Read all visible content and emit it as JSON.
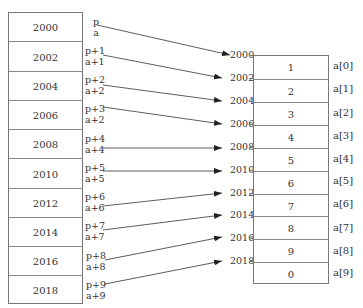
{
  "memory_block": {
    "addresses": [
      "2000",
      "2002",
      "2004",
      "2006",
      "2008",
      "2010",
      "2012",
      "2014",
      "2016",
      "2018"
    ]
  },
  "pointer_labels": [
    {
      "p": "p",
      "a": "a"
    },
    {
      "p": "p+1",
      "a": "a+1"
    },
    {
      "p": "p+2",
      "a": "a+2"
    },
    {
      "p": "p+3",
      "a": "a+2"
    },
    {
      "p": "p+4",
      "a": "a+4"
    },
    {
      "p": "p+5",
      "a": "a+5"
    },
    {
      "p": "p+6",
      "a": "a+6"
    },
    {
      "p": "p+7",
      "a": "a+7"
    },
    {
      "p": "p+8",
      "a": "a+8"
    },
    {
      "p": "p+9",
      "a": "a+9"
    }
  ],
  "array": {
    "addresses": [
      "2000",
      "2002",
      "2004",
      "2006",
      "2008",
      "2010",
      "2012",
      "2014",
      "2016",
      "2018"
    ],
    "values": [
      "1",
      "2",
      "3",
      "4",
      "5",
      "6",
      "7",
      "8",
      "9",
      "0"
    ],
    "names": [
      "a[0]",
      "a[1]",
      "a[2]",
      "a[3]",
      "a[4]",
      "a[5]",
      "a[6]",
      "a[7]",
      "a[8]",
      "a[9]"
    ]
  },
  "arrows": [
    {
      "from": [
        97,
        25
      ],
      "to": [
        230,
        55
      ]
    },
    {
      "from": [
        103,
        55
      ],
      "to": [
        222,
        78
      ]
    },
    {
      "from": [
        103,
        85
      ],
      "to": [
        222,
        101
      ]
    },
    {
      "from": [
        103,
        107
      ],
      "to": [
        222,
        124
      ]
    },
    {
      "from": [
        103,
        148
      ],
      "to": [
        222,
        148
      ]
    },
    {
      "from": [
        103,
        171
      ],
      "to": [
        222,
        171
      ]
    },
    {
      "from": [
        103,
        206
      ],
      "to": [
        222,
        193
      ]
    },
    {
      "from": [
        103,
        230
      ],
      "to": [
        222,
        215
      ]
    },
    {
      "from": [
        105,
        260
      ],
      "to": [
        222,
        237
      ]
    },
    {
      "from": [
        105,
        284
      ],
      "to": [
        222,
        261
      ]
    }
  ]
}
